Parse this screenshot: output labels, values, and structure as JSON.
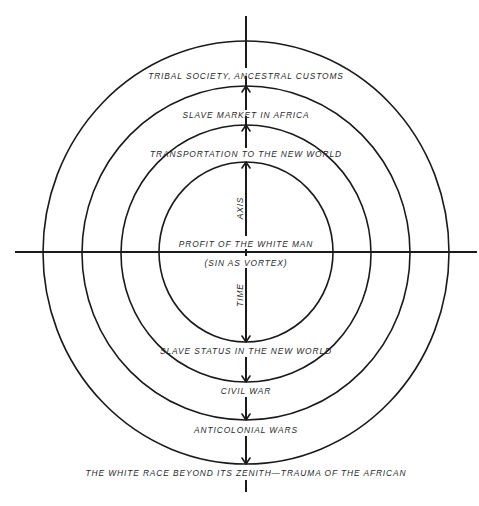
{
  "diagram": {
    "type": "concentric-circles",
    "colors": {
      "ink": "#1a1a1a",
      "background": "#ffffff"
    },
    "center": {
      "x": 246,
      "y": 252
    },
    "rings": [
      {
        "name": "outer",
        "rx": 203,
        "ry": 211
      },
      {
        "name": "second",
        "rx": 164,
        "ry": 167
      },
      {
        "name": "third",
        "rx": 125,
        "ry": 129
      },
      {
        "name": "inner",
        "rx": 87,
        "ry": 90
      }
    ],
    "horizontal_axis": {
      "x1": 15,
      "x2": 477,
      "y": 252
    },
    "vertical_axis_labels": {
      "upper": "AXIS",
      "lower": "TIME"
    },
    "center_labels": {
      "above_axis": "PROFIT OF THE WHITE MAN",
      "below_axis": "(SIN AS VORTEX)"
    },
    "upper_labels": [
      "TRIBAL SOCIETY, ANCESTRAL CUSTOMS",
      "SLAVE MARKET IN AFRICA",
      "TRANSPORTATION TO THE NEW WORLD"
    ],
    "lower_labels": [
      "SLAVE STATUS IN THE NEW WORLD",
      "CIVIL WAR",
      "ANTICOLONIAL WARS",
      "THE WHITE RACE BEYOND ITS ZENITH—TRAUMA OF THE AFRICAN"
    ]
  }
}
